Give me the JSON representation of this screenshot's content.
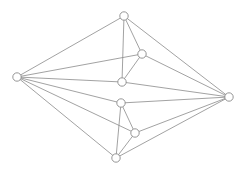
{
  "figure": {
    "title": "",
    "kind": "graph-drawing",
    "background_color": "#ffffff",
    "width": 245,
    "height": 174
  },
  "style": {
    "edge_color": "#8a8a8a",
    "edge_width": 0.8,
    "node_fill": "#ffffff",
    "node_stroke": "#8a8a8a",
    "node_stroke_width": 0.9,
    "node_radius": 4.2
  },
  "graph": {
    "node_count": 8,
    "edge_count": 16,
    "nodes": [
      {
        "id": "n0",
        "label": "",
        "x": 124,
        "y": 16
      },
      {
        "id": "n1",
        "label": "",
        "x": 17,
        "y": 77
      },
      {
        "id": "n2",
        "label": "",
        "x": 229,
        "y": 97
      },
      {
        "id": "n3",
        "label": "",
        "x": 116,
        "y": 158
      },
      {
        "id": "n4",
        "label": "",
        "x": 142,
        "y": 54
      },
      {
        "id": "n5",
        "label": "",
        "x": 122,
        "y": 82
      },
      {
        "id": "n6",
        "label": "",
        "x": 121,
        "y": 103
      },
      {
        "id": "n7",
        "label": "",
        "x": 135,
        "y": 133
      }
    ],
    "edges": [
      {
        "source": "n0",
        "target": "n1"
      },
      {
        "source": "n0",
        "target": "n2"
      },
      {
        "source": "n0",
        "target": "n4"
      },
      {
        "source": "n0",
        "target": "n5"
      },
      {
        "source": "n1",
        "target": "n4"
      },
      {
        "source": "n1",
        "target": "n5"
      },
      {
        "source": "n1",
        "target": "n6"
      },
      {
        "source": "n1",
        "target": "n7"
      },
      {
        "source": "n1",
        "target": "n3"
      },
      {
        "source": "n2",
        "target": "n4"
      },
      {
        "source": "n2",
        "target": "n5"
      },
      {
        "source": "n2",
        "target": "n6"
      },
      {
        "source": "n2",
        "target": "n7"
      },
      {
        "source": "n2",
        "target": "n3"
      },
      {
        "source": "n4",
        "target": "n5"
      },
      {
        "source": "n6",
        "target": "n7"
      },
      {
        "source": "n6",
        "target": "n3"
      },
      {
        "source": "n7",
        "target": "n3"
      }
    ]
  }
}
